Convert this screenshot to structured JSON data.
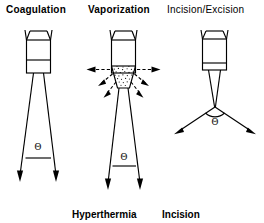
{
  "figure": {
    "width": 264,
    "height": 223,
    "background_color": "#ffffff",
    "line_color": "#000000"
  },
  "headers": {
    "coagulation": "Coagulation",
    "vaporization": "Vaporization",
    "incision_excision": "Incision/Excision"
  },
  "footers": {
    "hyperthermia": "Hyperthermia",
    "incision": "Incision"
  },
  "panels": [
    {
      "id": "coagulation",
      "header": "Coagulation",
      "footer": "Hyperthermia",
      "angle_symbol": "Θ",
      "beam": "diverging",
      "beam_arrowheads": 2,
      "arrow_direction": "down",
      "probe_divider": "upper",
      "description": "Defocused diverging beam producing bulk tissue heating"
    },
    {
      "id": "vaporization",
      "header": "Vaporization",
      "footer": "Incision",
      "angle_symbol": "Θ",
      "beam": "diverging",
      "beam_arrowheads": 2,
      "arrow_direction": "down",
      "probe_divider": "upper",
      "plume": "stippled",
      "radiating_arrows": 8,
      "horizontal_arrows": 2,
      "diagonal_arrows": 6,
      "arrow_style": "dashed",
      "description": "Vapor plume ejected radially from the tissue surface"
    },
    {
      "id": "incision-excision",
      "header": "Incision/Excision",
      "footer": "",
      "angle_symbol": "Θ",
      "beam": "converging-focused",
      "beam_arrowheads": 2,
      "arrow_direction": "outward-down",
      "probe_divider": "lower",
      "description": "Focused beam converging to a point then splaying at the surface"
    }
  ],
  "labels": {
    "theta": "Θ"
  }
}
